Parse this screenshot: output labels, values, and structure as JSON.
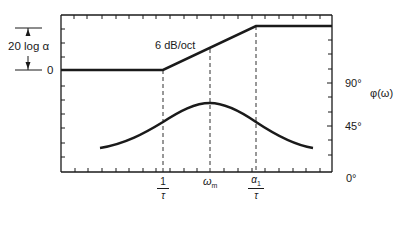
{
  "diagram": {
    "title": "",
    "magnitude_plot": {
      "gain_bracket_label": "20 log α",
      "zero_label": "0",
      "slope_label": "6 dB/oct"
    },
    "phase_plot": {
      "axis_title": "φ(ω)",
      "tick_labels": [
        "90°",
        "45°",
        "0°"
      ]
    },
    "x_axis": {
      "markers": [
        {
          "name": "corner-low",
          "num": "1",
          "den": "τ"
        },
        {
          "name": "omega-m",
          "label": "ω",
          "sub": "m"
        },
        {
          "name": "corner-high",
          "num": "α",
          "num_sub": "1",
          "den": "τ"
        }
      ]
    },
    "colors": {
      "line": "#1a1a1a",
      "background": "#ffffff"
    }
  }
}
